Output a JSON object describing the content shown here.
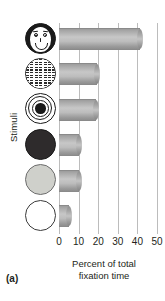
{
  "panel": {
    "label": "(a)"
  },
  "chart_data": {
    "type": "bar",
    "orientation": "horizontal",
    "title": "",
    "xlabel": "Percent of total fixation time",
    "ylabel": "Stimuli",
    "xlim": [
      0,
      50
    ],
    "xticks": [
      0,
      10,
      20,
      30,
      40,
      50
    ],
    "xtick_labels": [
      "0",
      "10",
      "20",
      "30",
      "40",
      "50"
    ],
    "grid": "vertical",
    "legend": "none",
    "categories": [
      "face",
      "newsprint",
      "bullseye",
      "dark-red circle",
      "light-gray circle",
      "white circle"
    ],
    "category_icons": [
      "face-icon",
      "newsprint-circle-icon",
      "bullseye-icon",
      "dark-circle-icon",
      "gray-circle-icon",
      "white-circle-icon"
    ],
    "values": [
      41.5,
      19.5,
      19.0,
      10.0,
      10.0,
      5.0
    ],
    "bar_color": "#b4b4b4"
  },
  "axis": {
    "ylabel": "Stimuli",
    "xlabel_line1": "Percent of total",
    "xlabel_line2": "fixation time"
  }
}
